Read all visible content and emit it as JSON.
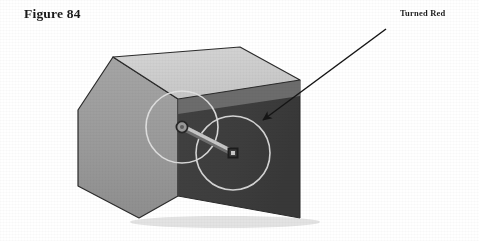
{
  "figure": {
    "title": "Figure 84",
    "callout_label": "Turned Red"
  },
  "colors": {
    "background": "#ffffff",
    "face_left": "#9a9a9a",
    "face_right": "#3d3d3d",
    "face_top": "#cfcfcf",
    "face_top_edge_band": "#6f6f6f",
    "outline": "#2b2b2b",
    "circle_stroke": "#d9d9d9",
    "rod_fill": "#b9b9b9",
    "rod_stroke": "#6e6e6e",
    "marker_dark": "#2a2a2a",
    "arrow": "#151515",
    "text": "#1a1a1a"
  },
  "scene": {
    "description": "Three-dimensional shaded box with chamfered corners; two overlapping circles with a connecting rod drawn on the right face; an arrow labelled Turned Red points to the right-hand circle.",
    "box": {
      "top_face_points": "113,57 240,47 300,80 178,99",
      "left_face_points": "78,110 113,57 178,99 178,196 139,218 78,186",
      "right_face_points": "178,99 300,80 300,218 178,196",
      "top_band_points": "178,99 300,80 300,95 178,113"
    },
    "circles": [
      {
        "name": "left-circle",
        "cx": 182,
        "cy": 127,
        "r": 36
      },
      {
        "name": "right-circle",
        "cx": 233,
        "cy": 153,
        "r": 37
      }
    ],
    "rod": {
      "x1": 182,
      "y1": 127,
      "x2": 233,
      "y2": 153,
      "width": 5
    },
    "markers": [
      {
        "name": "pivot-ring-marker",
        "cx": 182,
        "cy": 127,
        "type": "ring",
        "size": 9
      },
      {
        "name": "square-marker",
        "cx": 233,
        "cy": 153,
        "type": "square",
        "size": 8
      }
    ],
    "arrow": {
      "x1": 386,
      "y1": 29,
      "x2": 261,
      "y2": 122
    }
  }
}
